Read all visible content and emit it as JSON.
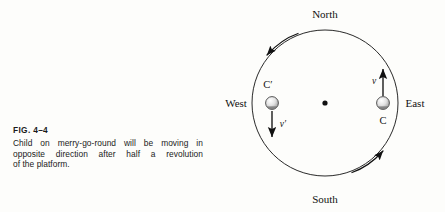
{
  "figure": {
    "number_label": "FIG. 4–4",
    "caption_lines": [
      "Child on merry-go-round will be moving in",
      "opposite direction after half a revolution",
      "of the platform."
    ],
    "caption_full": "Child on merry-go-round will be moving in opposite direction after half a revolution of the platform."
  },
  "diagram": {
    "type": "merry-go-round-rotation",
    "compass": {
      "north": "North",
      "south": "South",
      "east": "East",
      "west": "West"
    },
    "platform": {
      "center_dot": "•",
      "center_x": 119,
      "center_y": 103,
      "radius": 73
    },
    "positions": [
      {
        "id": "C",
        "label": "C",
        "side": "east",
        "x": 177,
        "y": 103,
        "label_x": 177,
        "label_y": 124,
        "velocity_label": "v",
        "velocity_direction": "north",
        "velocity_label_x": 168,
        "velocity_label_y": 83
      },
      {
        "id": "C-prime",
        "label": "C′",
        "side": "west",
        "x": 66,
        "y": 103,
        "label_x": 60,
        "label_y": 87,
        "velocity_label": "v′",
        "velocity_direction": "south",
        "velocity_label_x": 74,
        "velocity_label_y": 126
      }
    ],
    "rotation_arrows": [
      {
        "id": "upper-left-rotation-arrow",
        "direction": "counterclockwise",
        "location": "northwest-rim"
      },
      {
        "id": "lower-right-rotation-arrow",
        "direction": "counterclockwise",
        "location": "southeast-rim"
      }
    ],
    "colors": {
      "ink": "#111111",
      "background": "#fdfdfb",
      "child_body": "#d8d8d8"
    }
  }
}
